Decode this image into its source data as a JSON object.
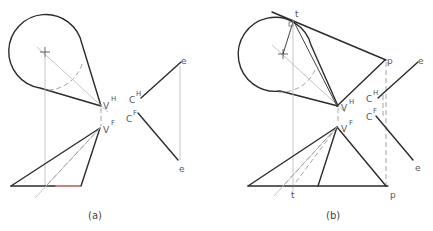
{
  "figure": {
    "panels": [
      {
        "id": "a",
        "caption": "(a)",
        "labels": {
          "v_top": "V",
          "v_top_sup": "H",
          "v_front": "V",
          "v_front_sup": "F",
          "c_top": "C",
          "c_top_sup": "H",
          "c_front": "C",
          "c_front_sup": "F",
          "e_top": "e",
          "e_bottom": "e"
        }
      },
      {
        "id": "b",
        "caption": "(b)",
        "labels": {
          "t_top": "t",
          "t_bottom": "t",
          "p_top": "p",
          "p_bottom": "p",
          "v_top": "V",
          "v_top_sup": "H",
          "v_front": "V",
          "v_front_sup": "F",
          "c_top": "C",
          "c_top_sup": "H",
          "c_front": "C",
          "c_front_sup": "F",
          "e_top": "e",
          "e_bottom": "e"
        }
      }
    ],
    "colors": {
      "object_line": "#2b2b2b",
      "projection_line": "#b8b8b8",
      "hidden_line": "#9a9a9a",
      "highlight_edge": "#b0504a"
    }
  }
}
